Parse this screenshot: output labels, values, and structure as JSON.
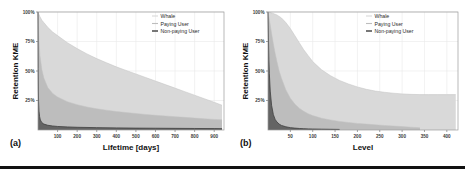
{
  "figure": {
    "background": "#ffffff",
    "rule_color": "#111111"
  },
  "panels": [
    {
      "id": "a",
      "sublabel": "(a)",
      "ylabel": "Retention KME",
      "xlabel": "Lifetime [days]",
      "yticks": [
        "25%",
        "50%",
        "75%",
        "100%"
      ],
      "ytick_values": [
        25,
        50,
        75,
        100
      ],
      "xticks": [
        "100",
        "200",
        "300",
        "400",
        "500",
        "600",
        "700",
        "800",
        "900"
      ],
      "xtick_values": [
        100,
        200,
        300,
        400,
        500,
        600,
        700,
        800,
        900
      ],
      "legend": [
        {
          "label": "Whale",
          "color": "#d9d9d9"
        },
        {
          "label": "Paying User",
          "color": "#bdbdbd"
        },
        {
          "label": "Non-paying User",
          "color": "#555555"
        }
      ]
    },
    {
      "id": "b",
      "sublabel": "(b)",
      "ylabel": "Retention KME",
      "xlabel": "Level",
      "yticks": [
        "25%",
        "50%",
        "75%",
        "100%"
      ],
      "ytick_values": [
        25,
        50,
        75,
        100
      ],
      "xticks": [
        "50",
        "100",
        "150",
        "200",
        "250",
        "300",
        "350",
        "400"
      ],
      "xtick_values": [
        50,
        100,
        150,
        200,
        250,
        300,
        350,
        400
      ],
      "legend": [
        {
          "label": "Whale",
          "color": "#d9d9d9"
        },
        {
          "label": "Paying User",
          "color": "#bdbdbd"
        },
        {
          "label": "Non-paying User",
          "color": "#555555"
        }
      ]
    }
  ],
  "chart_data": [
    {
      "type": "area",
      "panel": "a",
      "title": "",
      "xlabel": "Lifetime [days]",
      "ylabel": "Retention KME",
      "xlim": [
        0,
        950
      ],
      "ylim": [
        0,
        100
      ],
      "grid": true,
      "legend_position": "top-right",
      "series": [
        {
          "name": "Whale",
          "color": "#d9d9d9",
          "x": [
            0,
            5,
            10,
            20,
            30,
            50,
            75,
            100,
            150,
            200,
            250,
            300,
            350,
            400,
            450,
            500,
            550,
            600,
            650,
            700,
            750,
            800,
            850,
            900,
            940
          ],
          "y": [
            100,
            98,
            96,
            93,
            91,
            87,
            83,
            80,
            74,
            69,
            64.5,
            60.5,
            57,
            53.5,
            50.5,
            47.5,
            44.5,
            41.5,
            38.5,
            35.5,
            32.5,
            29.5,
            26.5,
            23.5,
            21
          ]
        },
        {
          "name": "Paying User",
          "color": "#bdbdbd",
          "x": [
            0,
            3,
            5,
            10,
            20,
            30,
            50,
            75,
            100,
            150,
            200,
            250,
            300,
            350,
            400,
            450,
            500,
            550,
            600,
            650,
            700,
            750,
            800,
            850,
            900,
            940
          ],
          "y": [
            100,
            85,
            76,
            63,
            51,
            44,
            36,
            31,
            28,
            24,
            21.5,
            19.5,
            18,
            16.8,
            15.7,
            14.8,
            14,
            13.2,
            12.5,
            11.9,
            11.3,
            10.7,
            10.1,
            9.5,
            9,
            8.6
          ]
        },
        {
          "name": "Non-paying User",
          "color": "#555555",
          "x": [
            0,
            1,
            2,
            3,
            5,
            8,
            12,
            20,
            30,
            50,
            75,
            100,
            150,
            200,
            300,
            400,
            500,
            600,
            700,
            800,
            900,
            940
          ],
          "y": [
            100,
            52,
            33,
            24,
            16,
            11.5,
            8.5,
            6.2,
            5.0,
            4.0,
            3.4,
            3.0,
            2.6,
            2.3,
            2.0,
            1.8,
            1.6,
            1.5,
            1.4,
            1.3,
            1.2,
            1.15
          ]
        }
      ]
    },
    {
      "type": "area",
      "panel": "b",
      "title": "",
      "xlabel": "Level",
      "ylabel": "Retention KME",
      "xlim": [
        0,
        425
      ],
      "ylim": [
        0,
        100
      ],
      "grid": true,
      "legend_position": "top-right",
      "series": [
        {
          "name": "Whale",
          "color": "#d9d9d9",
          "x": [
            0,
            5,
            10,
            20,
            30,
            40,
            50,
            60,
            70,
            80,
            90,
            100,
            120,
            140,
            160,
            180,
            200,
            220,
            240,
            260,
            280,
            300,
            320,
            340,
            360,
            380,
            400,
            420
          ],
          "y": [
            100,
            99.5,
            99,
            97.5,
            95,
            91,
            86,
            80,
            74,
            68,
            63,
            58,
            51,
            46,
            42,
            39,
            36.5,
            34.5,
            33,
            32,
            31.2,
            30.6,
            30.2,
            30,
            30,
            30,
            30,
            30
          ]
        },
        {
          "name": "Paying User",
          "color": "#bdbdbd",
          "x": [
            0,
            2,
            5,
            8,
            12,
            16,
            20,
            25,
            30,
            40,
            50,
            60,
            70,
            80,
            90,
            100,
            120,
            140,
            160,
            180,
            200,
            220,
            240,
            260,
            280,
            300,
            320,
            340
          ],
          "y": [
            100,
            96,
            89,
            82,
            73,
            65,
            58,
            50,
            44,
            34,
            27,
            22,
            18.5,
            15.8,
            13.8,
            12.2,
            10,
            8.5,
            7.3,
            6.4,
            5.6,
            5.0,
            4.4,
            3.9,
            3.4,
            2.9,
            2.4,
            1.9
          ]
        },
        {
          "name": "Non-paying User",
          "color": "#555555",
          "x": [
            0,
            1,
            2,
            3,
            5,
            8,
            12,
            16,
            20,
            25,
            30,
            40,
            50,
            60,
            70,
            80,
            90,
            100,
            120,
            140,
            160
          ],
          "y": [
            100,
            78,
            60,
            48,
            33,
            21,
            13,
            9,
            6.8,
            5.0,
            3.9,
            2.7,
            2.0,
            1.6,
            1.3,
            1.1,
            0.95,
            0.85,
            0.7,
            0.6,
            0.5
          ]
        }
      ]
    }
  ]
}
